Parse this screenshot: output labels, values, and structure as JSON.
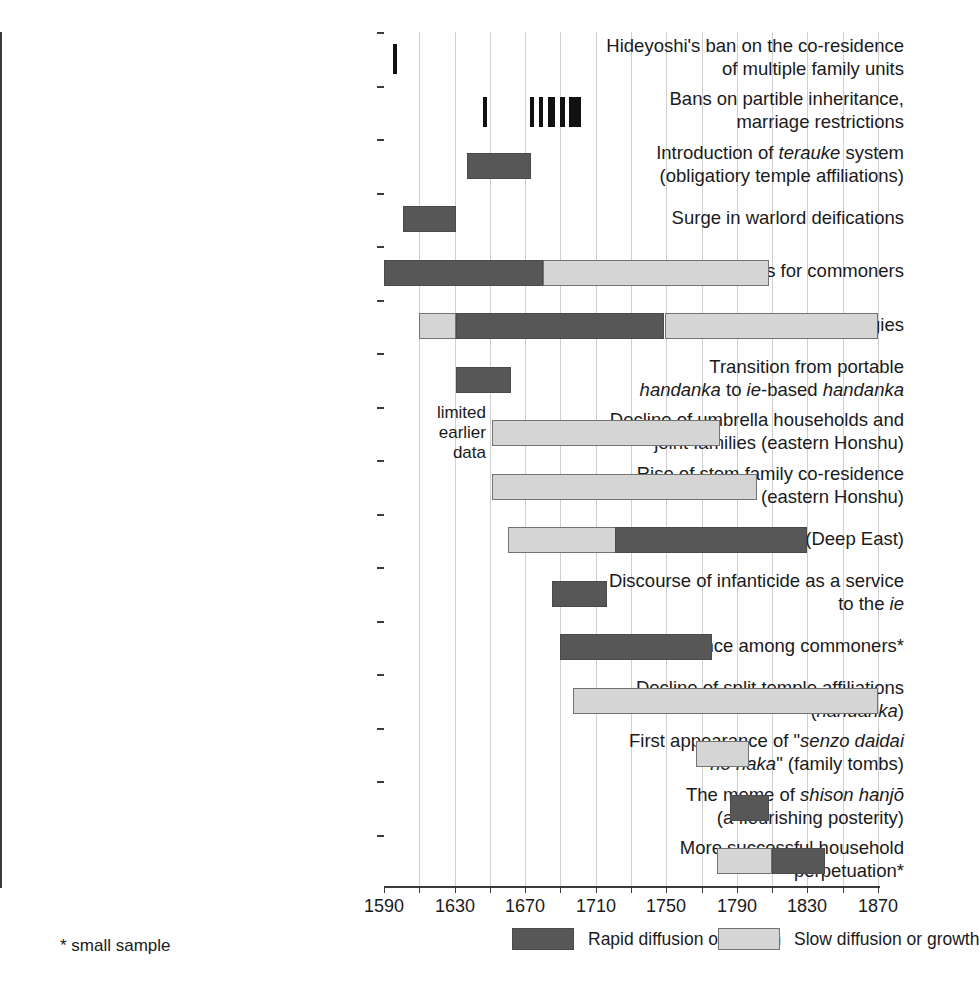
{
  "chart_data": {
    "type": "bar",
    "chart_kind": "timeline-gantt",
    "title": "",
    "xlabel": "",
    "ylabel": "",
    "xlim": [
      1590,
      1870
    ],
    "xticks": [
      1590,
      1610,
      1630,
      1650,
      1670,
      1690,
      1710,
      1730,
      1750,
      1770,
      1790,
      1810,
      1830,
      1850,
      1870
    ],
    "xtick_labels": [
      "1590",
      "",
      "1630",
      "",
      "1670",
      "",
      "1710",
      "",
      "1750",
      "",
      "1790",
      "",
      "1830",
      "",
      "1870"
    ],
    "grid": true,
    "legend_position": "bottom",
    "legend": [
      {
        "key": "rapid",
        "label": "Rapid diffusion or growth",
        "color": "#575757"
      },
      {
        "key": "slow",
        "label": "Slow diffusion or growth",
        "color": "#d5d5d5"
      }
    ],
    "annotations": [
      {
        "text": "limited earlier data",
        "lines": [
          "limited",
          "earlier",
          "data"
        ],
        "near_rows": [
          7,
          8
        ]
      }
    ],
    "footnote": "* small sample",
    "categories": [
      "Hideyoshi's ban on the co-residence of multiple family units",
      "Bans on partible inheritance, marriage restrictions",
      "Introduction of terauke system (obligatiory temple affiliations)",
      "Surge in warlord deifications",
      "Tombstones for commoners",
      "Kakochō necrologies",
      "Transition from portable handanka to ie-based handanka",
      "Decline of umbrella households and joint families (eastern Honshu)",
      "Rise of stem family co-residence (eastern Honshu)",
      "Adoption of heirs (Deep East)",
      "Discourse of infanticide as a service to the ie",
      "Name inheritance among commoners*",
      "Decline of split temple affiliations (handanka)",
      "First appearance of \"senzo daidai no haka\" (family tombs)",
      "The meme of shison hanjō (a flourishing posterity)",
      "More successful household perpetuation*"
    ],
    "rows": [
      {
        "index": 0,
        "label_lines": [
          {
            "text": "Hideyoshi's ban on the co-residence",
            "italic_parts": []
          },
          {
            "text": "of multiple family units",
            "italic_parts": []
          }
        ],
        "segments": [
          {
            "type": "rapid",
            "start": 1595,
            "end": 1597,
            "marker": true
          }
        ]
      },
      {
        "index": 1,
        "label_lines": [
          {
            "text": "Bans on partible inheritance,",
            "italic_parts": []
          },
          {
            "text": "marriage restrictions",
            "italic_parts": []
          }
        ],
        "segments": [
          {
            "type": "rapid",
            "start": 1646,
            "end": 1648,
            "marker": true
          },
          {
            "type": "rapid",
            "start": 1673,
            "end": 1675,
            "marker": true
          },
          {
            "type": "rapid",
            "start": 1678,
            "end": 1680,
            "marker": true
          },
          {
            "type": "rapid",
            "start": 1683,
            "end": 1687,
            "marker": true
          },
          {
            "type": "rapid",
            "start": 1690,
            "end": 1693,
            "marker": true
          },
          {
            "type": "rapid",
            "start": 1695,
            "end": 1702,
            "marker": true
          }
        ]
      },
      {
        "index": 2,
        "label_lines": [
          {
            "text": "Introduction of terauke system",
            "italic_parts": [
              "terauke"
            ]
          },
          {
            "text": "(obligatiory temple affiliations)",
            "italic_parts": []
          }
        ],
        "segments": [
          {
            "type": "rapid",
            "start": 1637,
            "end": 1673
          }
        ]
      },
      {
        "index": 3,
        "label_lines": [
          {
            "text": "Surge in warlord deifications",
            "italic_parts": []
          }
        ],
        "segments": [
          {
            "type": "rapid",
            "start": 1601,
            "end": 1631
          }
        ]
      },
      {
        "index": 4,
        "label_lines": [
          {
            "text": "Tombstones for commoners",
            "italic_parts": []
          }
        ],
        "segments": [
          {
            "type": "rapid",
            "start": 1590,
            "end": 1680
          },
          {
            "type": "slow",
            "start": 1680,
            "end": 1808
          }
        ]
      },
      {
        "index": 5,
        "label_lines": [
          {
            "text": "Kakochō necrologies",
            "italic_parts": []
          }
        ],
        "segments": [
          {
            "type": "slow",
            "start": 1610,
            "end": 1631
          },
          {
            "type": "rapid",
            "start": 1631,
            "end": 1749
          },
          {
            "type": "slow",
            "start": 1749,
            "end": 1870
          }
        ]
      },
      {
        "index": 6,
        "label_lines": [
          {
            "text": "Transition from portable",
            "italic_parts": []
          },
          {
            "text": "handanka to ie-based handanka",
            "italic_parts": [
              "handanka",
              "ie",
              "handanka"
            ]
          }
        ],
        "segments": [
          {
            "type": "rapid",
            "start": 1631,
            "end": 1662
          }
        ]
      },
      {
        "index": 7,
        "label_lines": [
          {
            "text": "Decline of umbrella households and",
            "italic_parts": []
          },
          {
            "text": "joint families (eastern Honshu)",
            "italic_parts": []
          }
        ],
        "segments": [
          {
            "type": "slow",
            "start": 1651,
            "end": 1780
          }
        ]
      },
      {
        "index": 8,
        "label_lines": [
          {
            "text": "Rise of stem family co-residence",
            "italic_parts": []
          },
          {
            "text": "(eastern Honshu)",
            "italic_parts": []
          }
        ],
        "segments": [
          {
            "type": "slow",
            "start": 1651,
            "end": 1801
          }
        ]
      },
      {
        "index": 9,
        "label_lines": [
          {
            "text": "Adoption of heirs (Deep East)",
            "italic_parts": []
          }
        ],
        "segments": [
          {
            "type": "slow",
            "start": 1660,
            "end": 1721
          },
          {
            "type": "rapid",
            "start": 1721,
            "end": 1830
          }
        ]
      },
      {
        "index": 10,
        "label_lines": [
          {
            "text": "Discourse of infanticide as a service",
            "italic_parts": []
          },
          {
            "text": "to the ie",
            "italic_parts": [
              "ie"
            ]
          }
        ],
        "segments": [
          {
            "type": "rapid",
            "start": 1685,
            "end": 1716
          }
        ]
      },
      {
        "index": 11,
        "label_lines": [
          {
            "text": "Name inheritance among commoners*",
            "italic_parts": []
          }
        ],
        "segments": [
          {
            "type": "rapid",
            "start": 1690,
            "end": 1776
          }
        ]
      },
      {
        "index": 12,
        "label_lines": [
          {
            "text": "Decline of split temple affiliations",
            "italic_parts": []
          },
          {
            "text": "(handanka)",
            "italic_parts": [
              "handanka"
            ]
          }
        ],
        "segments": [
          {
            "type": "slow",
            "start": 1697,
            "end": 1870
          }
        ]
      },
      {
        "index": 13,
        "label_lines": [
          {
            "text": "First appearance of \"senzo daidai",
            "italic_parts": [
              "senzo daidai"
            ]
          },
          {
            "text": "no haka\" (family tombs)",
            "italic_parts": [
              "no haka"
            ]
          }
        ],
        "segments": [
          {
            "type": "slow",
            "start": 1767,
            "end": 1797
          }
        ]
      },
      {
        "index": 14,
        "label_lines": [
          {
            "text": "The meme of shison hanjō",
            "italic_parts": [
              "shison hanjō"
            ]
          },
          {
            "text": "(a flourishing posterity)",
            "italic_parts": []
          }
        ],
        "segments": [
          {
            "type": "rapid",
            "start": 1786,
            "end": 1808
          }
        ]
      },
      {
        "index": 15,
        "label_lines": [
          {
            "text": "More successful household",
            "italic_parts": []
          },
          {
            "text": "perpetuation*",
            "italic_parts": []
          }
        ],
        "segments": [
          {
            "type": "slow",
            "start": 1779,
            "end": 1810
          },
          {
            "type": "rapid",
            "start": 1810,
            "end": 1840
          }
        ]
      }
    ]
  },
  "colors": {
    "rapid": "#575757",
    "slow": "#d5d5d5",
    "axis": "#3b3b3b",
    "grid": "#cfcfcf",
    "text": "#1a1a1a"
  }
}
